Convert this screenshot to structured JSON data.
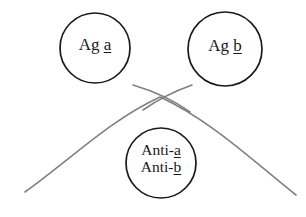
{
  "diagram": {
    "type": "genetics-crossover-schematic",
    "background_color": "#ffffff",
    "circle_stroke_color": "#1a1a1a",
    "curve_stroke_color": "#808080",
    "text_color": "#1a1a1a",
    "nodes": [
      {
        "id": "ag-a",
        "prefix": "Ag ",
        "allele": "a",
        "full_text": "Ag a",
        "cx": 95,
        "cy": 48,
        "r": 35
      },
      {
        "id": "ag-b",
        "prefix": "Ag ",
        "allele": "b",
        "full_text": "Ag b",
        "cx": 225,
        "cy": 49,
        "r": 37
      },
      {
        "id": "anti-ab",
        "line1_prefix": "Anti-",
        "line1_allele": "a",
        "line2_prefix": "Anti-",
        "line2_allele": "b",
        "full_text": "Anti-a Anti-b",
        "cx": 161,
        "cy": 163,
        "r": 35
      }
    ],
    "curves": [
      {
        "id": "arc-main",
        "description": "long arc peaking near top center sweeping to both bottom corners"
      },
      {
        "id": "arc-stub",
        "description": "short crossing stroke forming an X near top center"
      }
    ]
  }
}
